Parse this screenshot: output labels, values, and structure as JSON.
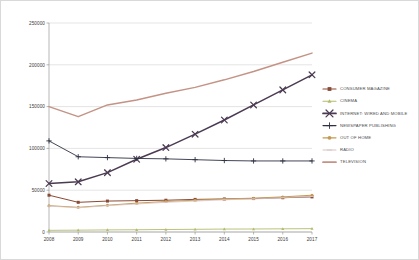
{
  "chart_data": {
    "type": "line",
    "title": "",
    "xlabel": "",
    "ylabel": "",
    "categories": [
      "2008",
      "2009",
      "2010",
      "2011",
      "2012",
      "2013",
      "2014",
      "2015",
      "2016",
      "2017"
    ],
    "ylim": [
      0,
      250000
    ],
    "yticks": [
      "0",
      "50000",
      "100000",
      "150000",
      "200000",
      "250000"
    ],
    "ytick_values": [
      0,
      50000,
      100000,
      150000,
      200000,
      250000
    ],
    "grid": true,
    "legend_position": "right",
    "series": [
      {
        "name": "CONSUMER MAGAZINE",
        "color": "#8a4a35",
        "marker": "square",
        "values": [
          44000,
          35500,
          37000,
          37500,
          38000,
          39000,
          39500,
          40000,
          41000,
          42000
        ]
      },
      {
        "name": "CINEMA",
        "color": "#b3bc6a",
        "marker": "triangle",
        "values": [
          2000,
          2200,
          2500,
          2700,
          3000,
          3200,
          3500,
          3600,
          3800,
          4000
        ]
      },
      {
        "name": "INTERNET: WIRED AND MOBILE",
        "color": "#4b3b52",
        "marker": "x",
        "values": [
          58000,
          60000,
          71000,
          87000,
          101000,
          117000,
          134000,
          152000,
          170000,
          188000
        ]
      },
      {
        "name": "NEWSPAPER PUBLISHING",
        "color": "#2e3142",
        "marker": "plus",
        "values": [
          109000,
          90000,
          89000,
          88000,
          87500,
          86500,
          85500,
          85000,
          85000,
          85000
        ]
      },
      {
        "name": "OUT OF HOME",
        "color": "#c49a52",
        "marker": "circle",
        "values": [
          31500,
          29500,
          32000,
          34500,
          36500,
          38000,
          39500,
          40500,
          42000,
          44000
        ]
      },
      {
        "name": "RADIO",
        "color": "#d8c3c3",
        "marker": "dash",
        "values": [
          31000,
          29000,
          31500,
          33500,
          35500,
          37000,
          38500,
          39500,
          41000,
          42500
        ]
      },
      {
        "name": "TELEVISION",
        "color": "#c49385",
        "marker": "none",
        "values": [
          150000,
          138000,
          152000,
          158000,
          166000,
          173000,
          182000,
          192000,
          203000,
          214000
        ]
      }
    ]
  }
}
